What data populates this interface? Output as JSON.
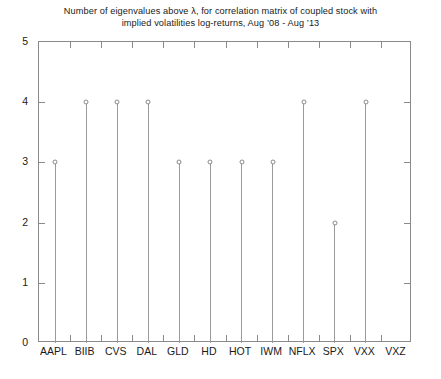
{
  "chart_data": {
    "type": "bar",
    "plot_style": "stem",
    "title": "Number of eigenvalues above λ, for correlation matrix of coupled stock with\nimplied volatilities log-returns, Aug ’08 - Aug ’13",
    "title_line1": "Number of eigenvalues above λ, for correlation matrix of coupled stock with",
    "title_line2": "implied volatilities log-returns, Aug ’08 - Aug ’13",
    "xlabel": "",
    "ylabel": "",
    "categories": [
      "AAPL",
      "BIIB",
      "CVS",
      "DAL",
      "GLD",
      "HD",
      "HOT",
      "IWM",
      "NFLX",
      "SPX",
      "VXX",
      "VXZ"
    ],
    "values": [
      3,
      4,
      4,
      4,
      3,
      3,
      3,
      3,
      4,
      2,
      4,
      0
    ],
    "ylim": [
      0,
      5
    ],
    "ytick_labels": [
      "0",
      "1",
      "2",
      "3",
      "4",
      "5"
    ],
    "ytick_values": [
      0,
      1,
      2,
      3,
      4,
      5
    ],
    "grid": false,
    "legend": null,
    "marker": "open-circle",
    "colors": {
      "background": "#ffffff",
      "axis": "#8a8a8a",
      "stem": "#9a9a9a",
      "marker_edge": "#8a8a8a",
      "marker_fill": "#ffffff",
      "text": "#1a1a1a"
    }
  }
}
